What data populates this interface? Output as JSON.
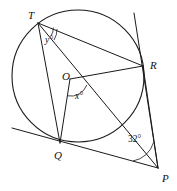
{
  "figure": {
    "canvas": {
      "width": 177,
      "height": 191,
      "background": "#ffffff"
    },
    "stroke_color": "#1a1a1a"
  },
  "circle": {
    "name": "circle-o",
    "center_label": "O",
    "center": {
      "x": 78,
      "y": 76
    },
    "radius": 66
  },
  "points": [
    {
      "id": "T",
      "label": "T",
      "x": 38,
      "y": 23,
      "label_x": 28,
      "label_y": 19,
      "on_circle": true
    },
    {
      "id": "R",
      "label": "R",
      "x": 143,
      "y": 66,
      "label_x": 150,
      "label_y": 69,
      "on_circle": true
    },
    {
      "id": "Q",
      "label": "Q",
      "x": 60,
      "y": 143,
      "label_x": 54,
      "label_y": 159,
      "on_circle": true
    },
    {
      "id": "O",
      "label": "O",
      "x": 70,
      "y": 79,
      "label_x": 62,
      "label_y": 80,
      "on_circle": false
    },
    {
      "id": "P",
      "label": "P",
      "x": 158,
      "y": 168,
      "label_x": 162,
      "label_y": 182,
      "on_circle": false
    }
  ],
  "segments": [
    {
      "name": "segment-TR",
      "from": "T",
      "to": "R"
    },
    {
      "name": "segment-TQ",
      "from": "T",
      "to": "Q"
    },
    {
      "name": "segment-TP",
      "from": "T",
      "to": "P"
    },
    {
      "name": "segment-OR",
      "from": "O",
      "to": "R"
    },
    {
      "name": "segment-OQ",
      "from": "O",
      "to": "Q"
    },
    {
      "name": "segment-QP",
      "from": "Q",
      "to": "P"
    },
    {
      "name": "segment-RP",
      "from": "R",
      "to": "P"
    }
  ],
  "tangent_line": {
    "name": "tangent-at-Q",
    "x1": 12,
    "y1": 128,
    "x2": 158,
    "y2": 168
  },
  "secant_extension": {
    "name": "line-through-R-extended",
    "x1": 134,
    "y1": 13,
    "x2": 158,
    "y2": 168
  },
  "angles": [
    {
      "id": "angle-y",
      "vertex": "T",
      "label": "y",
      "unit": "°",
      "label_x": 45,
      "label_y": 43,
      "arc_radius": 16
    },
    {
      "id": "angle-x",
      "vertex": "O",
      "label": "x",
      "unit": "°",
      "label_x": 75,
      "label_y": 99,
      "arc_radius": 17
    },
    {
      "id": "angle-32",
      "vertex": "P",
      "label": "32",
      "unit": "°",
      "value": 32,
      "label_x": 128,
      "label_y": 142,
      "arc_radius": 26
    }
  ],
  "labels": {
    "T": "T",
    "R": "R",
    "Q": "Q",
    "O": "O",
    "P": "P",
    "angle_y": "y°",
    "angle_x": "x°",
    "angle_32": "32°"
  }
}
